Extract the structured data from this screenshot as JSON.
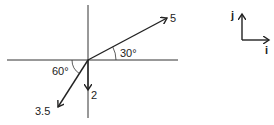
{
  "diagram": {
    "type": "vector-diagram",
    "vectors": [
      {
        "magnitude_label": "5",
        "angle_label": "30°",
        "direction": "30° above +x axis"
      },
      {
        "magnitude_label": "2",
        "direction": "straight down (-y)"
      },
      {
        "magnitude_label": "3.5",
        "angle_label": "60°",
        "direction": "60° below -x axis"
      }
    ],
    "unit_vectors": {
      "i_label": "i",
      "j_label": "j"
    }
  }
}
